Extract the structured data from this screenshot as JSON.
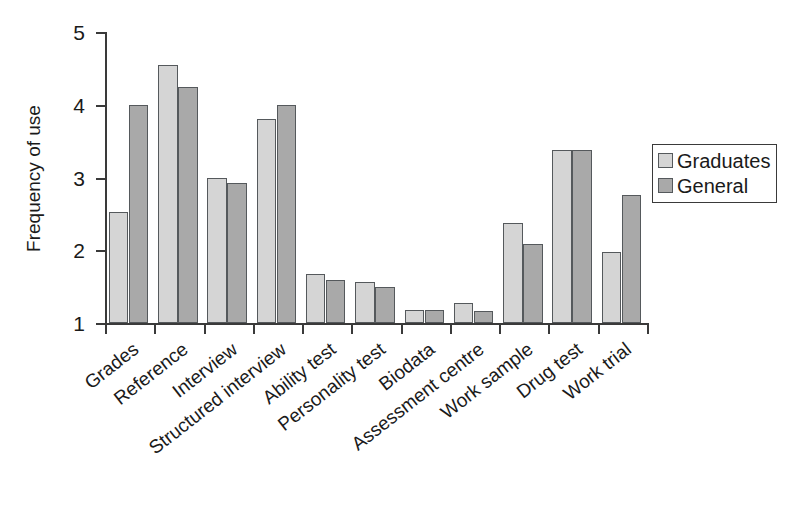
{
  "chart_data": {
    "type": "bar",
    "title": "",
    "xlabel": "",
    "ylabel": "Frequency of use",
    "ylim": [
      1,
      5
    ],
    "yticks": [
      1,
      2,
      3,
      4,
      5
    ],
    "ytick_labels": [
      "1",
      "2",
      "3",
      "4",
      "5"
    ],
    "grid": false,
    "legend_position": "right",
    "categories": [
      "Grades",
      "Reference",
      "Interview",
      "Structured interview",
      "Ability test",
      "Personality test",
      "Biodata",
      "Assessment centre",
      "Work sample",
      "Drug test",
      "Work trial"
    ],
    "series": [
      {
        "name": "Graduates",
        "color": "#d5d5d5",
        "values": [
          2.52,
          4.54,
          2.99,
          3.8,
          1.68,
          1.57,
          1.18,
          1.27,
          2.38,
          3.38,
          1.97
        ]
      },
      {
        "name": "General",
        "color": "#a9a9a9",
        "values": [
          4.0,
          4.24,
          2.93,
          4.0,
          1.59,
          1.49,
          1.18,
          1.17,
          2.08,
          3.38,
          2.76
        ]
      }
    ]
  },
  "legend": {
    "entries": [
      {
        "label": "Graduates",
        "swatch": "light"
      },
      {
        "label": "General",
        "swatch": "dark"
      }
    ]
  }
}
